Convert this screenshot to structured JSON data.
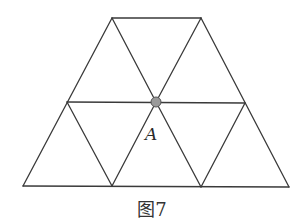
{
  "figure": {
    "caption": "图7",
    "point": {
      "label": "A",
      "fill": "#9a9a9a",
      "stroke": "#555555"
    },
    "vertices": {
      "T1": [
        112,
        18
      ],
      "T2": [
        201,
        18
      ],
      "M1": [
        67,
        102
      ],
      "A": [
        156,
        102
      ],
      "M2": [
        245,
        103
      ],
      "B1": [
        23,
        186
      ],
      "B2": [
        112,
        186
      ],
      "B3": [
        201,
        187
      ],
      "B4": [
        289,
        187
      ]
    },
    "edges": [
      [
        "T1",
        "T2"
      ],
      [
        "M1",
        "M2"
      ],
      [
        "B1",
        "B4"
      ],
      [
        "T1",
        "B1"
      ],
      [
        "T2",
        "B4"
      ],
      [
        "T1",
        "A"
      ],
      [
        "A",
        "B3"
      ],
      [
        "M2",
        "B3"
      ],
      [
        "T2",
        "A"
      ],
      [
        "A",
        "B2"
      ],
      [
        "M1",
        "B2"
      ]
    ],
    "line_color": "#3a3a3a"
  }
}
